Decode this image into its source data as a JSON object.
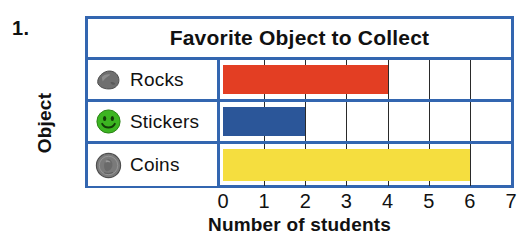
{
  "problem_number": "1.",
  "y_axis_title": "Object",
  "x_axis_title": "Number of students",
  "chart_title": "Favorite Object to Collect",
  "colors": {
    "frame_blue": "#3366b0",
    "gridline": "#2a2a2a",
    "rocks_bar": "#e33e23",
    "stickers_bar": "#2b5699",
    "coins_bar": "#f5de3f",
    "rock_icon": "#6f6f6f",
    "sticker_icon": "#3cb521",
    "coin_icon": "#7a7a7a",
    "page_background": "#ffffff",
    "text": "#111111"
  },
  "rows": [
    {
      "label": "Rocks",
      "icon": "rock-icon",
      "value": 4,
      "bar_color": "#e33e23"
    },
    {
      "label": "Stickers",
      "icon": "sticker-icon",
      "value": 2,
      "bar_color": "#2b5699"
    },
    {
      "label": "Coins",
      "icon": "coin-icon",
      "value": 6,
      "bar_color": "#f5de3f"
    }
  ],
  "x_ticks": [
    "0",
    "1",
    "2",
    "3",
    "4",
    "5",
    "6",
    "7"
  ],
  "chart_data": {
    "type": "bar",
    "orientation": "horizontal",
    "title": "Favorite Object to Collect",
    "xlabel": "Number of students",
    "ylabel": "Object",
    "categories": [
      "Rocks",
      "Stickers",
      "Coins"
    ],
    "values": [
      4,
      2,
      6
    ],
    "series": [
      {
        "name": "Number of students",
        "values": [
          4,
          2,
          6
        ]
      }
    ],
    "xlim": [
      0,
      7
    ],
    "xticks": [
      0,
      1,
      2,
      3,
      4,
      5,
      6,
      7
    ],
    "grid": true,
    "legend": "none",
    "bar_colors": [
      "#e33e23",
      "#2b5699",
      "#f5de3f"
    ]
  }
}
